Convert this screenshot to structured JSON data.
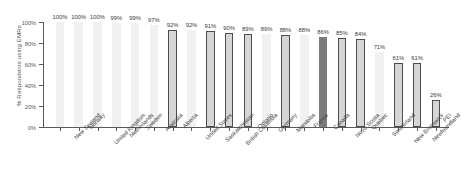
{
  "chart_data": {
    "type": "bar",
    "title": "",
    "xlabel": "",
    "ylabel": "% Respondents using EMRs",
    "ylim": [
      0,
      100
    ],
    "ytick_labels": [
      "100%",
      "80%",
      "60%",
      "40%",
      "20%",
      "0%"
    ],
    "ytick_values": [
      100,
      80,
      60,
      40,
      20,
      0
    ],
    "grid": false,
    "legend": null,
    "categories": [
      "New Zealand",
      "Norway",
      "United Kingdom",
      "Netherlands",
      "Sweden",
      "Australia",
      "Alberta",
      "United States",
      "Saskatchewan",
      "British Columbia",
      "Ontario",
      "Germany",
      "Manitoba",
      "France",
      "Canada",
      "Nova Scotia",
      "Quebec",
      "Switzerland",
      "New Brunswick",
      "Newfoundland",
      "PEI"
    ],
    "values": [
      100,
      100,
      100,
      99,
      99,
      97,
      92,
      92,
      91,
      90,
      89,
      89,
      88,
      88,
      86,
      85,
      84,
      71,
      61,
      61,
      26
    ],
    "value_labels": [
      "100%",
      "100%",
      "100%",
      "99%",
      "99%",
      "97%",
      "92%",
      "92%",
      "91%",
      "90%",
      "89%",
      "89%",
      "88%",
      "88%",
      "86%",
      "85%",
      "84%",
      "71%",
      "61%",
      "61%",
      "26%"
    ],
    "bar_styles": [
      "plain",
      "plain",
      "plain",
      "plain",
      "plain",
      "plain",
      "outlined",
      "plain",
      "outlined",
      "outlined",
      "outlined",
      "plain",
      "outlined",
      "plain",
      "solid",
      "outlined",
      "outlined",
      "plain",
      "outlined",
      "outlined",
      "outlined"
    ],
    "colors": {
      "plain_fill": "#f1f1f1",
      "outlined_fill": "#d6d6d6",
      "outlined_border": "#4d4d4d",
      "solid_fill": "#7b7b7b",
      "axis": "#5a5a5a",
      "text": "#454545"
    }
  }
}
